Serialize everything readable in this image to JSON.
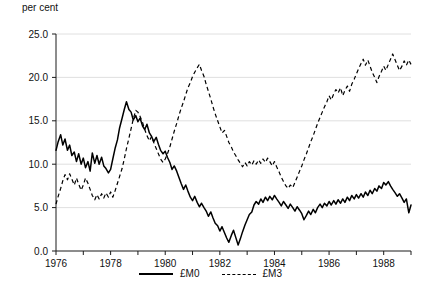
{
  "chart_data": {
    "type": "line",
    "title": "",
    "subtitle": "",
    "unit_label": "per cent",
    "xlabel": "",
    "ylabel": "",
    "ylim": [
      0.0,
      25.0
    ],
    "xlim": [
      1976.0,
      1989.0
    ],
    "yticks": [
      "0.0",
      "5.0",
      "10.0",
      "15.0",
      "20.0",
      "25.0"
    ],
    "ytick_values": [
      0.0,
      5.0,
      10.0,
      15.0,
      20.0,
      25.0
    ],
    "xticks": [
      "1976",
      "1978",
      "1980",
      "1982",
      "1984",
      "1986",
      "1988"
    ],
    "xtick_values": [
      1976,
      1978,
      1980,
      1982,
      1984,
      1986,
      1988
    ],
    "minor_xtick_values": [
      1977,
      1979,
      1981,
      1983,
      1985,
      1987,
      1989
    ],
    "grid": "horizontal",
    "legend_position": "bottom-center",
    "series": [
      {
        "name": "£M0",
        "style": "solid",
        "color": "#000000",
        "x": [
          1976.0,
          1976.08,
          1976.17,
          1976.25,
          1976.33,
          1976.42,
          1976.5,
          1976.58,
          1976.67,
          1976.75,
          1976.83,
          1976.92,
          1977.0,
          1977.08,
          1977.17,
          1977.25,
          1977.33,
          1977.42,
          1977.5,
          1977.58,
          1977.67,
          1977.75,
          1977.83,
          1977.92,
          1978.0,
          1978.08,
          1978.17,
          1978.25,
          1978.33,
          1978.42,
          1978.5,
          1978.58,
          1978.67,
          1978.75,
          1978.83,
          1978.92,
          1979.0,
          1979.08,
          1979.17,
          1979.25,
          1979.33,
          1979.42,
          1979.5,
          1979.58,
          1979.67,
          1979.75,
          1979.83,
          1979.92,
          1980.0,
          1980.08,
          1980.17,
          1980.25,
          1980.33,
          1980.42,
          1980.5,
          1980.58,
          1980.67,
          1980.75,
          1980.83,
          1980.92,
          1981.0,
          1981.08,
          1981.17,
          1981.25,
          1981.33,
          1981.42,
          1981.5,
          1981.58,
          1981.67,
          1981.75,
          1981.83,
          1981.92,
          1982.0,
          1982.08,
          1982.17,
          1982.25,
          1982.33,
          1982.42,
          1982.5,
          1982.58,
          1982.67,
          1982.75,
          1982.83,
          1982.92,
          1983.0,
          1983.08,
          1983.17,
          1983.25,
          1983.33,
          1983.42,
          1983.5,
          1983.58,
          1983.67,
          1983.75,
          1983.83,
          1983.92,
          1984.0,
          1984.08,
          1984.17,
          1984.25,
          1984.33,
          1984.42,
          1984.5,
          1984.58,
          1984.67,
          1984.75,
          1984.83,
          1984.92,
          1985.0,
          1985.08,
          1985.17,
          1985.25,
          1985.33,
          1985.42,
          1985.5,
          1985.58,
          1985.67,
          1985.75,
          1985.83,
          1985.92,
          1986.0,
          1986.08,
          1986.17,
          1986.25,
          1986.33,
          1986.42,
          1986.5,
          1986.58,
          1986.67,
          1986.75,
          1986.83,
          1986.92,
          1987.0,
          1987.08,
          1987.17,
          1987.25,
          1987.33,
          1987.42,
          1987.5,
          1987.58,
          1987.67,
          1987.75,
          1987.83,
          1987.92,
          1988.0,
          1988.08,
          1988.17,
          1988.25,
          1988.33,
          1988.42,
          1988.5,
          1988.58,
          1988.67,
          1988.75,
          1988.83,
          1988.92,
          1989.0
        ],
        "values": [
          11.6,
          12.6,
          13.4,
          12.2,
          12.9,
          11.6,
          12.2,
          11.0,
          11.4,
          10.3,
          11.2,
          10.0,
          10.7,
          9.6,
          10.3,
          9.2,
          11.3,
          10.1,
          11.0,
          10.0,
          10.8,
          9.8,
          9.5,
          9.0,
          9.4,
          10.6,
          11.9,
          12.8,
          14.2,
          15.3,
          16.3,
          17.2,
          16.3,
          16.0,
          15.1,
          15.6,
          14.9,
          15.3,
          14.4,
          14.0,
          14.6,
          13.6,
          13.2,
          12.6,
          13.1,
          12.3,
          11.6,
          11.2,
          11.5,
          10.8,
          10.2,
          9.4,
          9.8,
          9.2,
          8.5,
          7.8,
          7.1,
          7.6,
          6.9,
          6.2,
          5.8,
          6.3,
          5.6,
          5.1,
          5.5,
          5.0,
          4.6,
          4.0,
          4.5,
          3.8,
          3.2,
          2.9,
          2.3,
          2.8,
          2.1,
          1.5,
          1.0,
          1.8,
          2.4,
          1.6,
          0.7,
          1.4,
          2.2,
          3.0,
          3.6,
          4.2,
          4.5,
          5.3,
          5.7,
          5.4,
          6.0,
          5.6,
          6.2,
          5.8,
          6.3,
          5.9,
          6.4,
          6.0,
          5.6,
          5.2,
          5.7,
          5.3,
          4.9,
          5.4,
          5.0,
          4.6,
          5.1,
          4.7,
          4.3,
          3.6,
          4.1,
          4.6,
          4.2,
          4.8,
          4.4,
          5.0,
          5.4,
          5.0,
          5.5,
          5.2,
          5.7,
          5.3,
          5.8,
          5.4,
          5.9,
          5.5,
          6.0,
          5.6,
          6.2,
          5.8,
          6.4,
          6.0,
          6.5,
          6.1,
          6.6,
          6.2,
          6.8,
          6.4,
          7.0,
          6.6,
          7.2,
          6.9,
          7.5,
          7.2,
          7.9,
          7.6,
          8.0,
          7.5,
          7.1,
          6.7,
          6.3,
          6.6,
          6.1,
          5.6,
          6.0,
          4.4,
          5.3
        ]
      },
      {
        "name": "£M3",
        "style": "dashed",
        "color": "#000000",
        "x": [
          1976.0,
          1976.08,
          1976.17,
          1976.25,
          1976.33,
          1976.42,
          1976.5,
          1976.58,
          1976.67,
          1976.75,
          1976.83,
          1976.92,
          1977.0,
          1977.08,
          1977.17,
          1977.25,
          1977.33,
          1977.42,
          1977.5,
          1977.58,
          1977.67,
          1977.75,
          1977.83,
          1977.92,
          1978.0,
          1978.08,
          1978.17,
          1978.25,
          1978.33,
          1978.42,
          1978.5,
          1978.58,
          1978.67,
          1978.75,
          1978.83,
          1978.92,
          1979.0,
          1979.08,
          1979.17,
          1979.25,
          1979.33,
          1979.42,
          1979.5,
          1979.58,
          1979.67,
          1979.75,
          1979.83,
          1979.92,
          1980.0,
          1980.08,
          1980.17,
          1980.25,
          1980.33,
          1980.42,
          1980.5,
          1980.58,
          1980.67,
          1980.75,
          1980.83,
          1980.92,
          1981.0,
          1981.08,
          1981.17,
          1981.25,
          1981.33,
          1981.42,
          1981.5,
          1981.58,
          1981.67,
          1981.75,
          1981.83,
          1981.92,
          1982.0,
          1982.08,
          1982.17,
          1982.25,
          1982.33,
          1982.42,
          1982.5,
          1982.58,
          1982.67,
          1982.75,
          1982.83,
          1982.92,
          1983.0,
          1983.08,
          1983.17,
          1983.25,
          1983.33,
          1983.42,
          1983.5,
          1983.58,
          1983.67,
          1983.75,
          1983.83,
          1983.92,
          1984.0,
          1984.08,
          1984.17,
          1984.25,
          1984.33,
          1984.42,
          1984.5,
          1984.58,
          1984.67,
          1984.75,
          1984.83,
          1984.92,
          1985.0,
          1985.08,
          1985.17,
          1985.25,
          1985.33,
          1985.42,
          1985.5,
          1985.58,
          1985.67,
          1985.75,
          1985.83,
          1985.92,
          1986.0,
          1986.08,
          1986.17,
          1986.25,
          1986.33,
          1986.42,
          1986.5,
          1986.58,
          1986.67,
          1986.75,
          1986.83,
          1986.92,
          1987.0,
          1987.08,
          1987.17,
          1987.25,
          1987.33,
          1987.42,
          1987.5,
          1987.58,
          1987.67,
          1987.75,
          1987.83,
          1987.92,
          1988.0,
          1988.08,
          1988.17,
          1988.25,
          1988.33,
          1988.42,
          1988.5,
          1988.58,
          1988.67,
          1988.75,
          1988.83,
          1988.92,
          1989.0
        ],
        "values": [
          5.4,
          6.3,
          7.2,
          8.1,
          8.8,
          8.2,
          8.9,
          8.3,
          7.6,
          8.4,
          7.7,
          7.0,
          7.6,
          8.4,
          7.8,
          7.1,
          6.4,
          5.9,
          6.5,
          6.0,
          6.6,
          6.1,
          6.7,
          6.2,
          6.8,
          6.2,
          7.0,
          7.8,
          8.6,
          9.5,
          10.6,
          11.8,
          13.0,
          14.1,
          15.2,
          16.2,
          16.0,
          15.5,
          14.8,
          14.0,
          13.3,
          12.7,
          13.2,
          12.5,
          11.8,
          11.2,
          10.6,
          10.2,
          10.6,
          11.2,
          12.0,
          12.9,
          13.8,
          14.7,
          15.6,
          16.4,
          17.2,
          18.0,
          18.8,
          19.4,
          20.1,
          20.6,
          21.1,
          21.5,
          20.8,
          20.1,
          19.2,
          18.4,
          17.5,
          16.6,
          15.8,
          15.0,
          14.3,
          13.6,
          13.9,
          13.2,
          12.5,
          12.0,
          11.4,
          11.0,
          10.5,
          10.1,
          9.7,
          10.2,
          9.8,
          10.3,
          9.9,
          10.4,
          10.0,
          10.5,
          10.1,
          10.6,
          10.2,
          10.7,
          10.3,
          9.8,
          10.3,
          9.7,
          9.1,
          8.5,
          8.0,
          7.5,
          7.2,
          7.6,
          7.3,
          7.9,
          8.5,
          9.2,
          9.8,
          10.5,
          11.2,
          11.9,
          12.6,
          13.3,
          14.0,
          14.7,
          15.4,
          16.0,
          16.6,
          17.2,
          17.9,
          17.4,
          18.1,
          18.6,
          18.2,
          18.8,
          17.9,
          18.5,
          19.0,
          18.4,
          19.2,
          19.8,
          20.4,
          21.0,
          21.6,
          22.1,
          21.4,
          22.0,
          21.3,
          20.6,
          20.0,
          19.4,
          20.1,
          20.7,
          21.3,
          20.8,
          21.5,
          22.1,
          22.7,
          22.0,
          21.4,
          20.8,
          21.3,
          21.9,
          21.4,
          22.0,
          21.5
        ]
      }
    ]
  },
  "legend": {
    "items": [
      {
        "label": "£M0",
        "style": "solid"
      },
      {
        "label": "£M3",
        "style": "dashed"
      }
    ]
  }
}
